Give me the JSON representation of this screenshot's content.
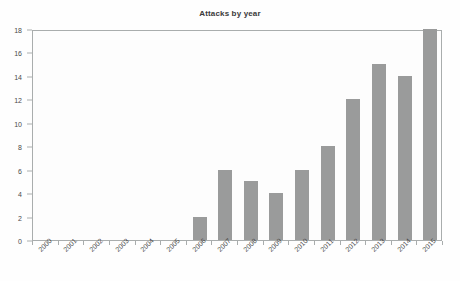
{
  "chart_data": {
    "type": "bar",
    "title": "Attacks by year",
    "xlabel": "",
    "ylabel": "",
    "categories": [
      "2000",
      "2001",
      "2002",
      "2003",
      "2004",
      "2005",
      "2006",
      "2007",
      "2008",
      "2009",
      "2010",
      "2011",
      "2012",
      "2013",
      "2014",
      "2015"
    ],
    "values": [
      0,
      0,
      0,
      0,
      0,
      0,
      2,
      6,
      5,
      4,
      6,
      8,
      12,
      15,
      14,
      18
    ],
    "ylim": [
      0,
      18
    ],
    "ytick_labels": [
      "0",
      "2",
      "4",
      "6",
      "8",
      "10",
      "12",
      "14",
      "16",
      "18"
    ],
    "ytick_values": [
      0,
      2,
      4,
      6,
      8,
      10,
      12,
      14,
      16,
      18
    ],
    "grid": false,
    "legend": null,
    "bar_color": "#9a9b9b",
    "axis_color": "#a9adad",
    "text_color": "#4a4a4a",
    "background_color": "#fefefe"
  }
}
